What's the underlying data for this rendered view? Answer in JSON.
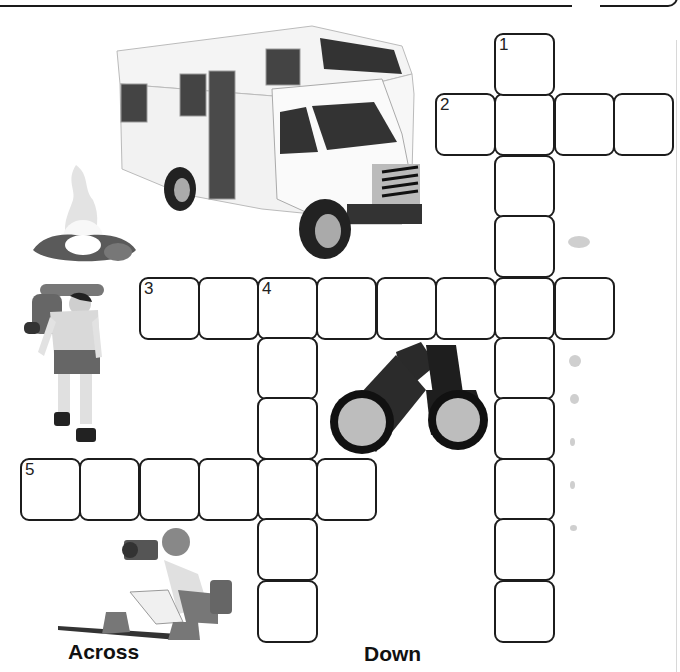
{
  "puzzle": {
    "type": "crossword",
    "cell_size_px": 60,
    "clues": {
      "across": [
        {
          "number": "2",
          "row": 1,
          "col": 7,
          "length": 4
        },
        {
          "number": "3",
          "row": 4,
          "col": 2,
          "length": 8
        },
        {
          "number": "5",
          "row": 7,
          "col": 0,
          "length": 6
        }
      ],
      "down": [
        {
          "number": "1",
          "row": 0,
          "col": 8,
          "length": 10
        },
        {
          "number": "4",
          "row": 4,
          "col": 4,
          "length": 6
        }
      ]
    }
  },
  "labels": {
    "across": "Across",
    "down": "Down"
  },
  "illustrations": [
    {
      "name": "motorhome",
      "description": "RV camper van"
    },
    {
      "name": "campfire",
      "description": "campfire with logs"
    },
    {
      "name": "hiker",
      "description": "hiker with backpack"
    },
    {
      "name": "binoculars",
      "description": "pair of binoculars"
    },
    {
      "name": "photographer",
      "description": "crouching photographer with camera"
    }
  ],
  "colors": {
    "cell_border": "#1c1c1c",
    "background": "#ffffff",
    "text": "#111111"
  }
}
